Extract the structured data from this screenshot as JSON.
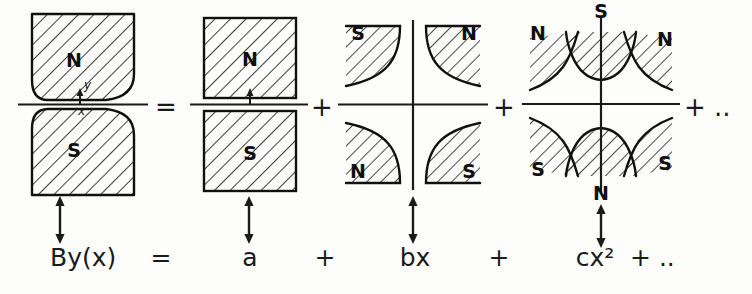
{
  "figure": {
    "background_color": "#fdfdfb",
    "ink_color": "#1a1a1a"
  },
  "axes": {
    "y_label": "y",
    "x_label": "x"
  },
  "diagrams": [
    {
      "id": "real-magnet",
      "kind": "real-dipole-curved",
      "poles": [
        {
          "label": "N",
          "position": "top"
        },
        {
          "label": "S",
          "position": "bottom"
        }
      ],
      "has_axes_labels": true
    },
    {
      "id": "dipole",
      "kind": "ideal-dipole-rectangular",
      "poles": [
        {
          "label": "N",
          "position": "top"
        },
        {
          "label": "S",
          "position": "bottom"
        }
      ],
      "has_axes_labels": false
    },
    {
      "id": "quadrupole",
      "kind": "quadrupole-hyperbolic",
      "poles": [
        {
          "label": "S",
          "position": "top-left"
        },
        {
          "label": "N",
          "position": "top-right"
        },
        {
          "label": "N",
          "position": "bottom-left"
        },
        {
          "label": "S",
          "position": "bottom-right"
        }
      ],
      "has_axes_labels": false
    },
    {
      "id": "sextupole",
      "kind": "sextupole-hyperbolic",
      "poles": [
        {
          "label": "S",
          "position": "top"
        },
        {
          "label": "N",
          "position": "upper-left"
        },
        {
          "label": "N",
          "position": "upper-right"
        },
        {
          "label": "S",
          "position": "lower-left"
        },
        {
          "label": "S",
          "position": "lower-right"
        },
        {
          "label": "N",
          "position": "bottom"
        }
      ],
      "has_axes_labels": false
    }
  ],
  "operators": {
    "equals": "=",
    "plus_1": "+",
    "plus_2": "+",
    "plus_ellipsis": "+ .."
  },
  "equation": {
    "lhs": "By(x)",
    "equals": "=",
    "term_a": "a",
    "plus_1": "+",
    "term_b": "bx",
    "plus_2": "+",
    "term_c": "cx²",
    "tail": "+ .."
  }
}
